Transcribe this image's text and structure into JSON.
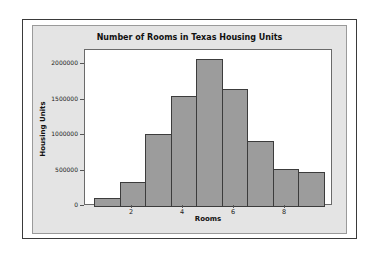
{
  "chart_data": {
    "type": "bar",
    "title": "Number of Rooms in Texas Housing Units",
    "xlabel": "Rooms",
    "ylabel": "Housing Units",
    "categories": [
      1,
      2,
      3,
      4,
      5,
      6,
      7,
      8,
      9
    ],
    "values": [
      115000,
      340000,
      1010000,
      1550000,
      2070000,
      1650000,
      910000,
      520000,
      480000
    ],
    "ylim": [
      0,
      2200000
    ],
    "xlim": [
      0.5,
      9.5
    ],
    "yticks": [
      0,
      500000,
      1000000,
      1500000,
      2000000
    ],
    "ytick_labels": [
      "0",
      "500000",
      "1000000",
      "1500000",
      "2000000"
    ],
    "xticks": [
      2,
      4,
      6,
      8
    ],
    "xtick_labels": [
      "2",
      "4",
      "6",
      "8"
    ],
    "grid": false,
    "legend": null,
    "colors": {
      "bar_fill": "#9c9c9c",
      "bar_edge": "#3c3c3c",
      "panel": "#e4e4e4",
      "plot_bg": "#ffffff"
    }
  }
}
